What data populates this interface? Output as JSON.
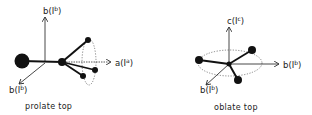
{
  "diagrams": [
    {
      "name": "prolate top",
      "caption": "prolate top",
      "axes": [
        {
          "id": "vertical",
          "base": "b",
          "paren": "(I",
          "sup": "b",
          "close": ")"
        },
        {
          "id": "horizontal",
          "base": "a",
          "paren": "(I",
          "sup": "a",
          "close": ")"
        },
        {
          "id": "diagonal",
          "base": "b",
          "paren": "(I",
          "sup": "b",
          "close": ")"
        }
      ]
    },
    {
      "name": "oblate top",
      "caption": "oblate top",
      "axes": [
        {
          "id": "vertical",
          "base": "c",
          "paren": "(I",
          "sup": "c",
          "close": ")"
        },
        {
          "id": "horizontal",
          "base": "b",
          "paren": "(I",
          "sup": "b",
          "close": ")"
        },
        {
          "id": "diagonal",
          "base": "b",
          "paren": "(I",
          "sup": "b",
          "close": ")"
        }
      ]
    }
  ],
  "colors": {
    "ink": "#222222",
    "background": "#ffffff"
  }
}
